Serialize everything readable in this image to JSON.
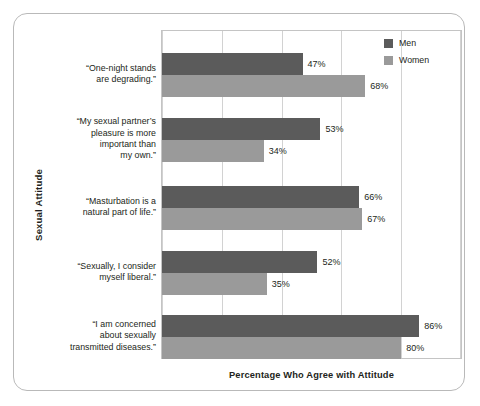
{
  "chart_data": {
    "type": "bar",
    "orientation": "horizontal",
    "title": "",
    "xlabel": "Percentage Who Agree with Attitude",
    "ylabel": "Sexual Attitude",
    "xlim": [
      0,
      100
    ],
    "grid": true,
    "gridline_values": [
      0,
      20,
      40,
      60,
      80,
      100
    ],
    "legend_position": "top-right",
    "value_suffix": "%",
    "categories": [
      "“One-night stands\nare degrading.”",
      "“My sexual partner’s\npleasure is more\nimportant than\nmy own.”",
      "“Masturbation is a\nnatural part of life.”",
      "“Sexually, I consider\nmyself liberal.”",
      "“I am concerned\nabout sexually\ntransmitted diseases.”"
    ],
    "series": [
      {
        "name": "Men",
        "color": "#5b5b5b",
        "values": [
          47,
          53,
          66,
          52,
          86
        ],
        "labels": [
          "47%",
          "53%",
          "66%",
          "52%",
          "86%"
        ]
      },
      {
        "name": "Women",
        "color": "#9a9a9a",
        "values": [
          68,
          34,
          67,
          35,
          80
        ],
        "labels": [
          "68%",
          "34%",
          "67%",
          "35%",
          "80%"
        ]
      }
    ]
  },
  "axes": {
    "y_title": "Sexual Attitude",
    "x_title": "Percentage Who Agree with Attitude"
  },
  "categories_display": [
    {
      "lines": [
        "“One-night stands",
        "are degrading.”"
      ]
    },
    {
      "lines": [
        "“My sexual partner’s",
        "pleasure is more",
        "important than",
        "my own.”"
      ]
    },
    {
      "lines": [
        "“Masturbation is a",
        "natural part of life.”"
      ]
    },
    {
      "lines": [
        "“Sexually, I consider",
        "myself liberal.”"
      ]
    },
    {
      "lines": [
        "“I am concerned",
        "about sexually",
        "transmitted diseases.”"
      ]
    }
  ],
  "legend": {
    "items": [
      {
        "label": "Men",
        "color": "#5b5b5b"
      },
      {
        "label": "Women",
        "color": "#9a9a9a"
      }
    ]
  },
  "colors": {
    "men": "#5b5b5b",
    "women": "#9a9a9a",
    "grid": "#d2d2d2",
    "frame": "#b9b9b9",
    "text": "#231f20"
  }
}
